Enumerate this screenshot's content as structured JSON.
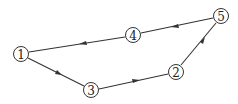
{
  "diagram": {
    "type": "directed-cycle-graph",
    "nodes": [
      {
        "id": "1",
        "label": "1",
        "x": 21,
        "y": 54
      },
      {
        "id": "3",
        "label": "3",
        "x": 91,
        "y": 90
      },
      {
        "id": "2",
        "label": "2",
        "x": 176,
        "y": 72
      },
      {
        "id": "5",
        "label": "5",
        "x": 221,
        "y": 16
      },
      {
        "id": "4",
        "label": "4",
        "x": 133,
        "y": 35
      }
    ],
    "edges": [
      {
        "from": "1",
        "to": "3"
      },
      {
        "from": "3",
        "to": "2"
      },
      {
        "from": "2",
        "to": "5"
      },
      {
        "from": "5",
        "to": "4"
      },
      {
        "from": "4",
        "to": "1"
      }
    ],
    "colors": {
      "stroke": "#333333",
      "background": "#ffffff"
    }
  }
}
